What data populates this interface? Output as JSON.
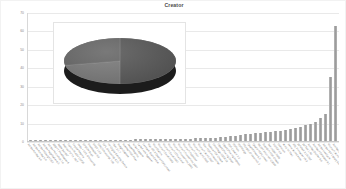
{
  "chart": {
    "title": "Creator",
    "type": "bar"
  },
  "chart_data": {
    "type": "bar",
    "title": "Creator",
    "xlabel": "",
    "ylabel": "",
    "ylim": [
      0,
      70
    ],
    "yticks": [
      0,
      10,
      20,
      30,
      40,
      50,
      60,
      70
    ],
    "ytick_labels": [
      "0",
      "10",
      "20",
      "30",
      "40",
      "50",
      "60",
      "70"
    ],
    "grid": true,
    "legend": false,
    "legend_position": "none",
    "categories": [
      "Adobe Acrobat 4.0",
      "Adobe Acrobat 5.0",
      "Adobe InDesign CS2",
      "Adobe PageMaker 6.5",
      "Adobe Photoshop 7.0",
      "ABBYY FineReader 8",
      "Apple pstopdf",
      "Aspose.Pdf for .NET",
      "Canon iR-ADV C5235",
      "Crystal Reports",
      "dvips + GPL Ghostscript",
      "EPSON Scan",
      "FineReader 9.0",
      "FPDF 1.53",
      "GNU Ghostscript 7.05",
      "GPL Ghostscript 8.15",
      "HP Digital Sending Device",
      "iText 2.1.7",
      "Image Capture",
      "Interleaf PDF Filter",
      "JasperReports",
      "Kofax Capture",
      "LaTeX with hyperref",
      "Lexmark Scan Center",
      "Mac OS X Quartz PDFContext",
      "MicroStation",
      "Microsoft Excel 2003",
      "Microsoft Excel 2007",
      "Microsoft Office Excel",
      "Microsoft PowerPoint 2003",
      "Microsoft PowerPoint 2007",
      "Microsoft Publisher",
      "Microsoft Visio",
      "Microsoft Word 2003",
      "Microsoft Word 2007",
      "Nitro PDF Professional",
      "Nuance PDF Create",
      "OmniPage CSDK18",
      "OpenOffice.org Draw",
      "OpenOffice.org Impress",
      "PDF Creator 2.2",
      "PDFium",
      "PDFMerge",
      "PScript5.dll Version 5.2",
      "QuarkXPress 6.5",
      "Quartz PDFContext",
      "RICOH Aficio MP C3500",
      "ScanSoft PDF Create",
      "TeX output 2009",
      "TCPDF 5.9",
      "Unknown",
      "Word for Mac",
      "Xerox WorkCentre",
      "XSL Formatter V4.3",
      "pdfeTeX 3.141592",
      "pdfTeX 1.40",
      "Acrobat Distiller 9.0",
      "Acrobat PDFMaker 9.1",
      "Adobe LiveCycle",
      "Adobe PDF Library 9.0",
      "Microsoft Word",
      "Acrobat Distiller 8.1"
    ],
    "values": [
      0.4,
      0.4,
      0.4,
      0.4,
      0.5,
      0.5,
      0.5,
      0.5,
      0.5,
      0.6,
      0.6,
      0.6,
      0.6,
      0.7,
      0.7,
      0.7,
      0.7,
      0.8,
      0.8,
      0.8,
      0.8,
      0.9,
      0.9,
      0.9,
      1.0,
      1.0,
      1.0,
      1.1,
      1.1,
      1.2,
      1.2,
      1.3,
      1.3,
      1.4,
      1.5,
      1.6,
      1.7,
      1.8,
      2.0,
      2.2,
      2.5,
      2.8,
      3.2,
      3.6,
      4.0,
      4.3,
      4.6,
      4.9,
      5.2,
      5.4,
      5.7,
      6.1,
      6.6,
      7.2,
      7.8,
      8.6,
      9.4,
      10.6,
      12.4,
      15.0,
      35.0,
      63.0
    ]
  },
  "pie_inset": {
    "type": "pie",
    "style": "3d",
    "slices": [
      {
        "label": "slice-1",
        "fraction": 0.5,
        "color": "#5c5c5c"
      },
      {
        "label": "slice-2",
        "fraction": 0.22,
        "color": "#7e7e7e"
      },
      {
        "label": "slice-3",
        "fraction": 0.28,
        "color": "#6a6a6a"
      }
    ],
    "side_color": "#1c1c1c"
  }
}
